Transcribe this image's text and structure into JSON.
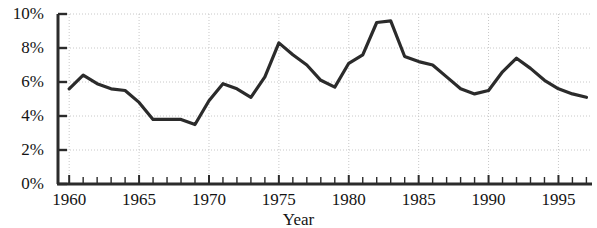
{
  "chart_data": {
    "type": "line",
    "title": "",
    "xlabel": "Year",
    "ylabel": "",
    "xlim": [
      1959.2,
      1997.4
    ],
    "ylim": [
      0,
      10
    ],
    "grid": true,
    "legend_position": "none",
    "line_color": "#2b2b2b",
    "line_width": 3.2,
    "y_tick_labels": [
      "0%",
      "2%",
      "4%",
      "6%",
      "8%",
      "10%"
    ],
    "y_tick_values": [
      0,
      2,
      4,
      6,
      8,
      10
    ],
    "x_tick_labels": [
      "1960",
      "1965",
      "1970",
      "1975",
      "1980",
      "1985",
      "1990",
      "1995"
    ],
    "x_tick_values": [
      1960,
      1965,
      1970,
      1975,
      1980,
      1985,
      1990,
      1995
    ],
    "x_minor_tick_values": [
      1960,
      1961,
      1962,
      1963,
      1964,
      1965,
      1966,
      1967,
      1968,
      1969,
      1970,
      1971,
      1972,
      1973,
      1974,
      1975,
      1976,
      1977,
      1978,
      1979,
      1980,
      1981,
      1982,
      1983,
      1984,
      1985,
      1986,
      1987,
      1988,
      1989,
      1990,
      1991,
      1992,
      1993,
      1994,
      1995,
      1996,
      1997
    ],
    "x": [
      1960,
      1961,
      1962,
      1963,
      1964,
      1965,
      1966,
      1967,
      1968,
      1969,
      1970,
      1971,
      1972,
      1973,
      1974,
      1975,
      1976,
      1977,
      1978,
      1979,
      1980,
      1981,
      1982,
      1983,
      1984,
      1985,
      1986,
      1987,
      1988,
      1989,
      1990,
      1991,
      1992,
      1993,
      1994,
      1995,
      1996,
      1997
    ],
    "values": [
      5.6,
      6.4,
      5.9,
      5.6,
      5.5,
      4.8,
      3.8,
      3.8,
      3.8,
      3.5,
      4.9,
      5.9,
      5.6,
      5.1,
      6.3,
      8.3,
      7.6,
      7.0,
      6.1,
      5.7,
      7.1,
      7.6,
      9.5,
      9.6,
      7.5,
      7.2,
      7.0,
      6.3,
      5.6,
      5.3,
      5.5,
      6.6,
      7.4,
      6.8,
      6.1,
      5.6,
      5.3,
      5.1
    ],
    "series_name": "Unemployment rate"
  }
}
